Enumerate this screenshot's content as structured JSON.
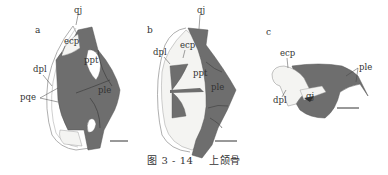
{
  "figure": {
    "caption": {
      "number": "图 3 - 14",
      "title": "上颌骨"
    },
    "panels": [
      {
        "letter": "a",
        "labels": {
          "qj": "qj",
          "ecp": "ecp",
          "ppt": "ppt",
          "dpl": "dpl",
          "pqe": "pqe",
          "ple": "ple"
        }
      },
      {
        "letter": "b",
        "labels": {
          "qj": "qj",
          "ecp": "ecp",
          "dpl": "dpl",
          "ppt": "ppt",
          "ple": "ple"
        }
      },
      {
        "letter": "c",
        "labels": {
          "ecp": "ecp",
          "ple": "ple",
          "dpl": "dpl",
          "qj": "qj"
        }
      }
    ],
    "colors": {
      "bone_dark": "#6e6e6e",
      "bone_light": "#f4f4f2",
      "outline": "#9a9a9a",
      "text": "#333333"
    }
  }
}
